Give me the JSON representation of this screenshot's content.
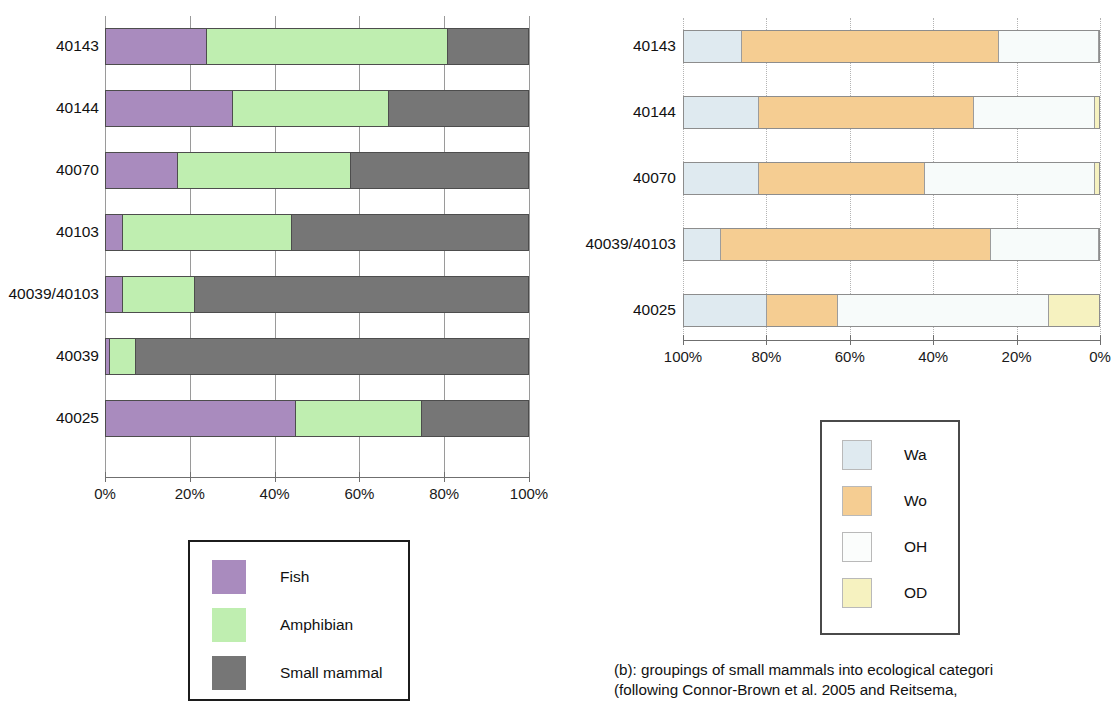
{
  "chart_data": [
    {
      "id": "chart-a",
      "type": "bar",
      "orientation": "horizontal",
      "stacked": true,
      "normalized": true,
      "title": "",
      "xlabel": "",
      "ylabel": "",
      "xlim": [
        0,
        100
      ],
      "x_reversed": false,
      "grid": true,
      "legend_position": "bottom-center",
      "tick_labels": [
        "0%",
        "20%",
        "40%",
        "60%",
        "80%",
        "100%"
      ],
      "tick_values": [
        0,
        20,
        40,
        60,
        80,
        100
      ],
      "categories": [
        "40143",
        "40144",
        "40070",
        "40103",
        "40039/40103",
        "40039",
        "40025"
      ],
      "series": [
        {
          "name": "Fish",
          "color": "#a98bbe",
          "values": [
            24,
            30,
            17,
            4,
            4,
            1,
            45
          ]
        },
        {
          "name": "Amphibian",
          "color": "#bfeeb0",
          "values": [
            57,
            37,
            41,
            40,
            17,
            6,
            30
          ]
        },
        {
          "name": "Small mammal",
          "color": "#767676",
          "values": [
            19,
            33,
            42,
            56,
            79,
            93,
            25
          ]
        }
      ]
    },
    {
      "id": "chart-b",
      "type": "bar",
      "orientation": "horizontal",
      "stacked": true,
      "normalized": true,
      "title": "",
      "xlabel": "",
      "ylabel": "",
      "xlim": [
        0,
        100
      ],
      "x_reversed": true,
      "grid": true,
      "legend_position": "below-center",
      "tick_labels": [
        "100%",
        "80%",
        "60%",
        "40%",
        "20%",
        "0%"
      ],
      "tick_values": [
        100,
        80,
        60,
        40,
        20,
        0
      ],
      "categories": [
        "40143",
        "40144",
        "40070",
        "40039/40103",
        "40025"
      ],
      "series": [
        {
          "name": "Wa",
          "color": "#dfeaf0",
          "values": [
            14,
            18,
            18,
            9,
            20
          ]
        },
        {
          "name": "Wo",
          "color": "#f5cd92",
          "values": [
            62,
            52,
            40,
            65,
            17
          ]
        },
        {
          "name": "OH",
          "color": "#f7fbfa",
          "values": [
            24,
            29,
            41,
            26,
            51
          ]
        },
        {
          "name": "OD",
          "color": "#f6f2c0",
          "values": [
            0,
            1,
            1,
            0,
            12
          ]
        }
      ]
    }
  ],
  "legend_a": {
    "items": [
      {
        "label": "Fish",
        "color": "#a98bbe"
      },
      {
        "label": "Amphibian",
        "color": "#bfeeb0"
      },
      {
        "label": "Small mammal",
        "color": "#767676"
      }
    ]
  },
  "legend_b": {
    "items": [
      {
        "label": "Wa",
        "color": "#dfeaf0"
      },
      {
        "label": "Wo",
        "color": "#f5cd92"
      },
      {
        "label": "OH",
        "color": "#fbfdfc"
      },
      {
        "label": "OD",
        "color": "#f6f2c0"
      }
    ]
  },
  "caption": {
    "line1": "(b): groupings of small mammals into ecological categori",
    "line2": "(following Connor-Brown et al. 2005 and Reitsema,"
  }
}
